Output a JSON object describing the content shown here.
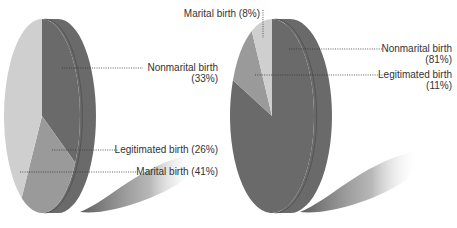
{
  "chart_data": [
    {
      "type": "pie",
      "style": "3d-tilted",
      "title": "",
      "slices": [
        {
          "label": "Nonmarital birth",
          "value": 33,
          "display": "(33%)",
          "color": "#6a6a6a"
        },
        {
          "label": "Legitimated birth",
          "value": 26,
          "display": "(26%)",
          "color": "#9a9a9a"
        },
        {
          "label": "Marital birth",
          "value": 41,
          "display": "(41%)",
          "color": "#cfcfcf"
        }
      ],
      "labels": {
        "nonmarital_line1": "Nonmarital birth",
        "nonmarital_line2": "(33%)",
        "legitimated": "Legitimated birth (26%)",
        "marital": "Marital birth (41%)"
      }
    },
    {
      "type": "pie",
      "style": "3d-tilted",
      "title": "",
      "slices": [
        {
          "label": "Nonmarital birth",
          "value": 81,
          "display": "(81%)",
          "color": "#6a6a6a"
        },
        {
          "label": "Legitimated birth",
          "value": 11,
          "display": "(11%)",
          "color": "#9a9a9a"
        },
        {
          "label": "Marital birth",
          "value": 8,
          "display": "(8%)",
          "color": "#cfcfcf"
        }
      ],
      "labels": {
        "marital": "Marital birth (8%)",
        "nonmarital_line1": "Nonmarital birth",
        "nonmarital_line2": "(81%)",
        "legitimated_line1": "Legitimated birth",
        "legitimated_line2": "(11%)"
      }
    }
  ],
  "colors": {
    "dark": "#6a6a6a",
    "mid": "#9a9a9a",
    "light": "#cfcfcf",
    "text": "#333333"
  }
}
